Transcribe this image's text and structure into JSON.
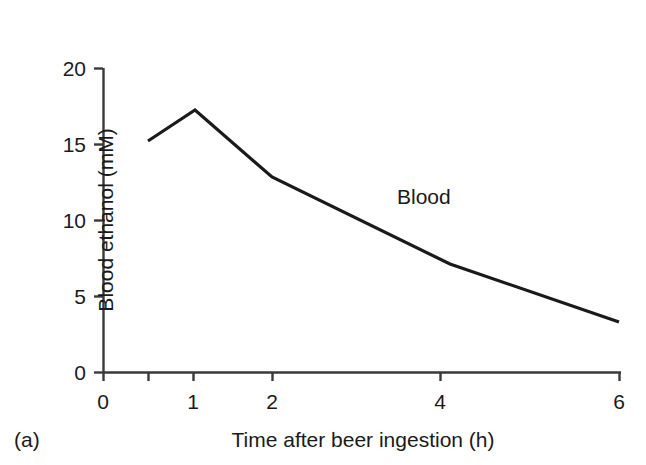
{
  "panel": {
    "label": "(a)"
  },
  "chart_data": {
    "type": "line",
    "title": "",
    "subtitle": "",
    "xlabel": "Time after beer ingestion (h)",
    "ylabel": "Blood ethanol (mM)",
    "xlim": [
      0,
      6
    ],
    "ylim": [
      0,
      20
    ],
    "grid": false,
    "legend_position": "inline-annotation",
    "x_axis_scale": "non-linear (compressed at larger times)",
    "x_tick_values": [
      0,
      0.5,
      1,
      2,
      4,
      6
    ],
    "x_tick_labels": [
      "0",
      "",
      "1",
      "2",
      "4",
      "6"
    ],
    "x_tick_pixels": [
      103,
      148,
      193,
      272,
      440,
      620
    ],
    "y_tick_values": [
      0,
      5,
      10,
      15,
      20
    ],
    "y_tick_labels": [
      "0",
      "5",
      "10",
      "15",
      "20"
    ],
    "y_tick_pixels": [
      372,
      296,
      220,
      144,
      68
    ],
    "series": [
      {
        "name": "Blood",
        "color": "#1a1a1a",
        "x": [
          0.5,
          1,
          2,
          4,
          6
        ],
        "y": [
          15.2,
          17.6,
          12.8,
          7.1,
          3.3
        ],
        "x_pixels": [
          148,
          195,
          272,
          450,
          619
        ],
        "y_pixels": [
          141,
          110,
          177,
          264,
          322
        ]
      }
    ],
    "annotations": [
      {
        "text": "Blood",
        "x_pixel": 397,
        "y_pixel": 196
      }
    ]
  }
}
